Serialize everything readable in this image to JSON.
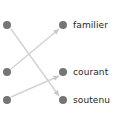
{
  "diagram": {
    "type": "bipartite-mapping",
    "background_color": "#ffffff",
    "node_color": "#757575",
    "edge_color": "#d2d2d2",
    "label_color": "#262626",
    "left_column": {
      "name": "source-nodes",
      "nodes": [
        {
          "id": "L1",
          "label": "",
          "x": 7,
          "y": 25
        },
        {
          "id": "L2",
          "label": "",
          "x": 7,
          "y": 72
        },
        {
          "id": "L3",
          "label": "",
          "x": 7,
          "y": 100
        }
      ]
    },
    "right_column": {
      "name": "target-nodes",
      "nodes": [
        {
          "id": "R1",
          "label": "familier",
          "x": 63,
          "y": 25,
          "label_x": 73
        },
        {
          "id": "R2",
          "label": "courant",
          "x": 63,
          "y": 72,
          "label_x": 73
        },
        {
          "id": "R3",
          "label": "soutenu",
          "x": 63,
          "y": 100,
          "label_x": 73
        }
      ]
    },
    "edges": [
      {
        "id": "E1",
        "from": "L1",
        "to": "R3",
        "x1": 11,
        "y1": 29,
        "x2": 59,
        "y2": 96,
        "direction": "down-right",
        "arrow": true
      },
      {
        "id": "E2",
        "from": "L2",
        "to": "R1",
        "x1": 11,
        "y1": 69,
        "x2": 59,
        "y2": 29,
        "direction": "up-right",
        "arrow": true
      },
      {
        "id": "E3",
        "from": "L3",
        "to": "R2",
        "x1": 11,
        "y1": 97,
        "x2": 59,
        "y2": 76,
        "direction": "up-right",
        "arrow": true
      }
    ]
  }
}
